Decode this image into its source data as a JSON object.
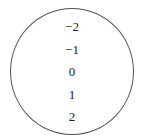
{
  "diagram": {
    "type": "set-circle",
    "elements": [
      "−2",
      "−1",
      "0",
      "1",
      "2"
    ]
  }
}
